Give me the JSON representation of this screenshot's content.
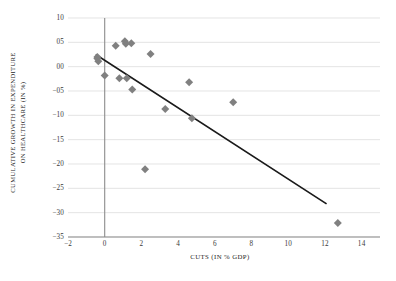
{
  "chart_data": {
    "type": "scatter",
    "title": "",
    "xlabel": "CUTS (IN % GDP)",
    "ylabel_line1": "CUMULATIVE GROWTH IN EXPENDITURE",
    "ylabel_line2": "ON HEALTHCARE (IN %)",
    "xlim": [
      -2,
      15
    ],
    "ylim": [
      -35,
      10
    ],
    "xticks": [
      -2,
      0,
      2,
      4,
      6,
      8,
      10,
      12,
      14
    ],
    "xtick_labels": [
      "−2",
      "0",
      "2",
      "4",
      "6",
      "8",
      "10",
      "12",
      "14"
    ],
    "yticks": [
      10,
      5,
      0,
      -5,
      -10,
      -15,
      -20,
      -25,
      -30,
      -35
    ],
    "ytick_labels": [
      "10",
      "05",
      "00",
      "−05",
      "−10",
      "−15",
      "−20",
      "−25",
      "−30",
      "−35"
    ],
    "grid": "horizontal",
    "legend": "none",
    "marker_shape": "diamond",
    "marker_color": "#808080",
    "trendline_color": "#1a1a1a",
    "gridline_color": "#d9d9d9",
    "axis_color": "#8c8c8c",
    "points": [
      {
        "x": -0.4,
        "y": 2.0
      },
      {
        "x": -0.4,
        "y": 1.7
      },
      {
        "x": -0.35,
        "y": 1.1
      },
      {
        "x": 0.0,
        "y": -1.8
      },
      {
        "x": 0.6,
        "y": 4.3
      },
      {
        "x": 0.8,
        "y": -2.4
      },
      {
        "x": 1.1,
        "y": 5.2
      },
      {
        "x": 1.15,
        "y": 4.7
      },
      {
        "x": 1.2,
        "y": -2.4
      },
      {
        "x": 1.45,
        "y": 4.8
      },
      {
        "x": 1.5,
        "y": -4.7
      },
      {
        "x": 2.2,
        "y": -21.1
      },
      {
        "x": 2.5,
        "y": 2.6
      },
      {
        "x": 3.3,
        "y": -8.7
      },
      {
        "x": 4.6,
        "y": -3.2
      },
      {
        "x": 4.75,
        "y": -10.6
      },
      {
        "x": 7.0,
        "y": -7.3
      },
      {
        "x": 12.7,
        "y": -32.1
      }
    ],
    "trendline": {
      "x0": -0.45,
      "y0": 2.4,
      "x1": 12.05,
      "y1": -28.1
    }
  }
}
